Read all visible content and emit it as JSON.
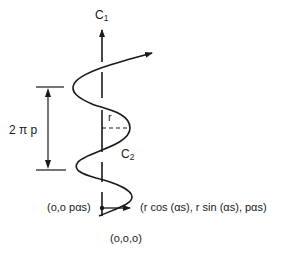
{
  "diagram": {
    "type": "helix-geometry",
    "colors": {
      "stroke": "#1a1a1a",
      "background": "#ffffff"
    },
    "labels": {
      "axis_label": "C",
      "axis_label_sub": "1",
      "curve_label": "C",
      "curve_label_sub": "2",
      "pitch_label": "2 π p",
      "radius_label": "r",
      "axis_point_label": "(o,o pαs)",
      "curve_point_label": "(r cos (αs), r sin (αs), pαs)",
      "origin_label": "(o,o,o)"
    },
    "elements": [
      {
        "name": "central-axis",
        "description": "vertical axis C1 with arrowhead at top"
      },
      {
        "name": "helix-curve",
        "description": "helical curve C2 winding around axis with arrow at end"
      },
      {
        "name": "pitch-dimension",
        "description": "double-arrow dimension line spanning one turn, 2πp"
      },
      {
        "name": "radius-line",
        "description": "dashed radius r from axis to curve"
      },
      {
        "name": "radial-vector",
        "description": "arrow from axis point to curve point"
      }
    ]
  }
}
